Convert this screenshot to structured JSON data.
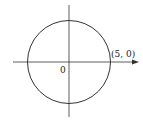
{
  "diagram": {
    "type": "circle-on-axes",
    "origin_label": "0",
    "point_label": "(5, 0)",
    "circle": {
      "center": [
        0,
        0
      ],
      "radius": 5
    },
    "colors": {
      "stroke": "#333333",
      "background": "#ffffff"
    }
  }
}
